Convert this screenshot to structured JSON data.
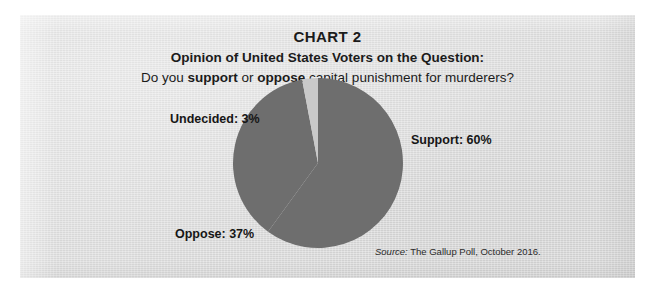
{
  "figure": {
    "title": "CHART 2",
    "subtitle": "Opinion of United States Voters on the Question:",
    "question": {
      "part1": "Do you ",
      "bold1": "support",
      "part2": " or ",
      "bold2": "oppose",
      "part3": " capital punishment for murderers?"
    },
    "source": {
      "label": "Source:",
      "text": " The Gallup Poll, October 2016."
    }
  },
  "labels": {
    "undecided": "Undecided: 3%",
    "support": "Support: 60%",
    "oppose": "Oppose: 37%"
  },
  "colors": {
    "panel_background": "#dedede",
    "page_background": "#ffffff",
    "slice_support": "#6e6e6e",
    "slice_oppose": "#6e6e6e",
    "slice_undecided": "#c9c9c9",
    "text": "#1b1b1b"
  },
  "chart_data": {
    "type": "pie",
    "title": "CHART 2",
    "subtitle": "Opinion of United States Voters on the Question: Do you support or oppose capital punishment for murderers?",
    "categories": [
      "Support",
      "Oppose",
      "Undecided"
    ],
    "values": [
      60,
      37,
      3
    ],
    "value_unit": "percent",
    "total": 100,
    "labels": [
      "Support: 60%",
      "Oppose: 37%",
      "Undecided: 3%"
    ],
    "slice_colors": [
      "#6e6e6e",
      "#6e6e6e",
      "#c9c9c9"
    ],
    "legend": "none",
    "data_labels": "outside",
    "start_angle_deg": 0,
    "direction": "clockwise",
    "source": "The Gallup Poll, October 2016."
  }
}
